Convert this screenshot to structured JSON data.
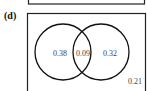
{
  "panel_label": "(d)",
  "venn": {
    "left_only": "0.38",
    "intersection": "0.09",
    "right_only": "0.32",
    "outside": "0.21"
  }
}
